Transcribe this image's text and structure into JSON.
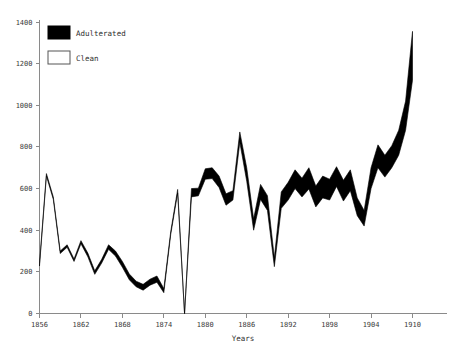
{
  "chart_data": {
    "type": "area",
    "title": "",
    "subtitle": "",
    "xlabel": "Years",
    "ylabel": "",
    "xlim": [
      1856,
      1912
    ],
    "ylim": [
      0,
      1400
    ],
    "grid": false,
    "legend_position": "top-left",
    "xticks": [
      1856,
      1862,
      1868,
      1874,
      1880,
      1886,
      1892,
      1898,
      1904,
      1910
    ],
    "yticks": [
      0,
      200,
      400,
      600,
      800,
      1000,
      1200,
      1400
    ],
    "series": [
      {
        "name": "Adulterated",
        "color": "#000000",
        "style": "filled",
        "note": "upper boundary of band; band between Clean and Adulterated is filled black",
        "values": [
          240,
          672,
          560,
          300,
          330,
          262,
          350,
          290,
          205,
          260,
          330,
          300,
          250,
          190,
          155,
          140,
          165,
          180,
          120,
          394,
          596,
          0,
          600,
          602,
          695,
          700,
          660,
          575,
          590,
          872,
          700,
          455,
          620,
          566,
          268,
          584,
          630,
          690,
          650,
          700,
          612,
          660,
          645,
          705,
          640,
          690,
          555,
          495,
          700,
          810,
          760,
          806,
          880,
          1020,
          1355
        ]
      },
      {
        "name": "Clean",
        "color": "#ffffff",
        "style": "outline",
        "note": "lower boundary of band",
        "values": [
          228,
          660,
          548,
          288,
          318,
          250,
          335,
          272,
          188,
          242,
          308,
          276,
          222,
          162,
          128,
          112,
          136,
          150,
          100,
          380,
          578,
          0,
          560,
          565,
          645,
          648,
          605,
          520,
          545,
          822,
          635,
          400,
          548,
          495,
          225,
          505,
          545,
          600,
          560,
          598,
          512,
          555,
          545,
          610,
          540,
          590,
          470,
          420,
          600,
          700,
          655,
          700,
          760,
          880,
          1120
        ]
      }
    ],
    "x": [
      1856,
      1857,
      1858,
      1859,
      1860,
      1861,
      1862,
      1863,
      1864,
      1865,
      1866,
      1867,
      1868,
      1869,
      1870,
      1871,
      1872,
      1873,
      1874,
      1875,
      1876,
      1877,
      1878,
      1879,
      1880,
      1881,
      1882,
      1883,
      1884,
      1885,
      1886,
      1887,
      1888,
      1889,
      1890,
      1891,
      1892,
      1893,
      1894,
      1895,
      1896,
      1897,
      1898,
      1899,
      1900,
      1901,
      1902,
      1903,
      1904,
      1905,
      1906,
      1907,
      1908,
      1909,
      1910
    ]
  },
  "legend": {
    "items": [
      {
        "label": "Adulterated",
        "swatch": "filled"
      },
      {
        "label": "Clean",
        "swatch": "outline"
      }
    ]
  },
  "axes": {
    "x_title": "Years"
  }
}
